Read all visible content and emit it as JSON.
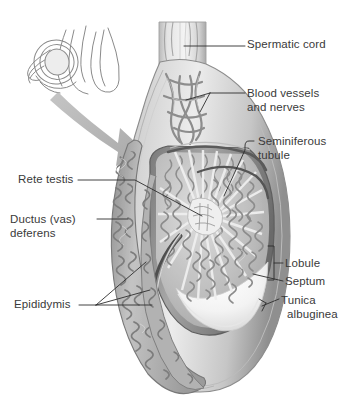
{
  "figure": {
    "style": "grayscale medical illustration",
    "colors": {
      "background": "#ffffff",
      "text": "#3a3a3a",
      "leader_line": "#2e2e2e",
      "outline": "#6f6f6f",
      "tunica_dark": "#6d6d6d",
      "tissue_mid": "#9a9a9a",
      "tissue_light": "#c9c9c9",
      "tubule_fill": "#b3b3b3",
      "mediastinum_light": "#eeeeee",
      "arrow_gray": "#a8a8a8",
      "inset_line": "#8a8a8a"
    }
  },
  "inset": {
    "name": "orientation-inset",
    "description": "line drawing of scrotum and penis showing orientation"
  },
  "arrow": {
    "name": "magnification-arrow",
    "description": "curved gray arrow from inset to main illustration"
  },
  "labels": [
    {
      "id": "spermatic-cord",
      "text": "Spermatic cord",
      "lines": [
        "Spermatic cord"
      ],
      "side": "right",
      "x": 247,
      "y": 38
    },
    {
      "id": "blood-vessels-and-nerves",
      "text": "Blood vessels and nerves",
      "lines": [
        "Blood vessels",
        "and nerves"
      ],
      "side": "right",
      "x": 247,
      "y": 86
    },
    {
      "id": "seminiferous-tubule",
      "text": "Seminiferous tubule",
      "lines": [
        "Seminiferous",
        "tubule"
      ],
      "side": "right",
      "x": 256,
      "y": 137
    },
    {
      "id": "rete-testis",
      "text": "Rete testis",
      "lines": [
        "Rete testis"
      ],
      "side": "left",
      "x": 18,
      "y": 174
    },
    {
      "id": "ductus-vas-deferens",
      "text": "Ductus (vas) deferens",
      "lines": [
        "Ductus (vas)",
        "deferens"
      ],
      "side": "left",
      "x": 10,
      "y": 212
    },
    {
      "id": "lobule",
      "text": "Lobule",
      "lines": [
        "Lobule"
      ],
      "side": "right",
      "x": 285,
      "y": 258
    },
    {
      "id": "septum",
      "text": "Septum",
      "lines": [
        "Septum"
      ],
      "side": "right",
      "x": 285,
      "y": 276
    },
    {
      "id": "tunica-albuginea",
      "text": "Tunica albuginea",
      "lines": [
        "Tunica",
        "albuginea"
      ],
      "side": "right",
      "x": 280,
      "y": 294
    },
    {
      "id": "epididymis",
      "text": "Epididymis",
      "lines": [
        "Epididymis"
      ],
      "side": "left",
      "x": 14,
      "y": 299
    }
  ]
}
